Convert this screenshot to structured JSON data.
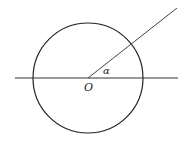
{
  "diagram": {
    "type": "geometry",
    "colors": {
      "stroke": "#222222",
      "ray": "#444444",
      "background": "#ffffff"
    },
    "circle": {
      "cx": 88,
      "cy": 78,
      "r": 55
    },
    "axis": {
      "x1": 15,
      "y1": 78,
      "x2": 178,
      "y2": 78
    },
    "ray": {
      "x1": 88,
      "y1": 78,
      "x2": 177,
      "y2": 8
    },
    "labels": {
      "center": "O",
      "angle": "α"
    }
  }
}
